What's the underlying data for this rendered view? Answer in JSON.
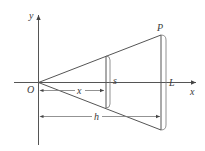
{
  "diagram": {
    "title": "",
    "labels": {
      "y_axis": "y",
      "x_axis": "x",
      "origin": "O",
      "apex": "P",
      "slant_length": "L",
      "slice_side": "s",
      "slice_distance": "x",
      "height": "h"
    },
    "colors": {
      "line": "#555555",
      "text": "#3a3a3a",
      "background": "#ffffff"
    }
  }
}
